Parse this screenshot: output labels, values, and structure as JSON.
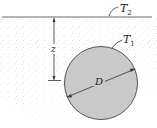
{
  "diagram": {
    "surface_label": "T",
    "surface_label_sub": "2",
    "cylinder_label": "T",
    "cylinder_label_sub": "1",
    "depth_label": "z",
    "diameter_label": "D",
    "colors": {
      "cylinder_fill": "#c9c9c9",
      "cylinder_stroke": "#555555",
      "surface_line": "#666666",
      "soil_dots": "#b0b0b0"
    }
  }
}
